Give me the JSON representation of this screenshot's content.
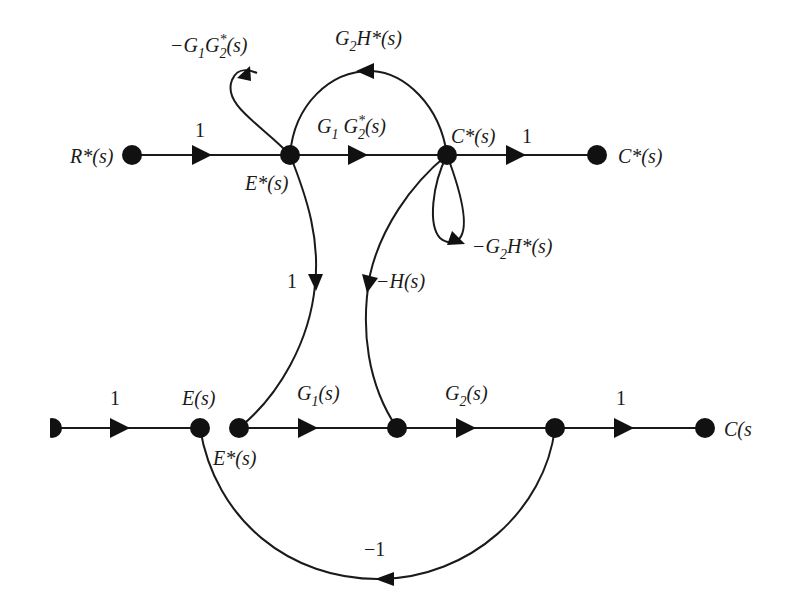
{
  "diagram": {
    "type": "signal-flow-graph",
    "nodes": [
      {
        "id": "R_star",
        "label": "R*(s)",
        "x": 132,
        "y": 155
      },
      {
        "id": "E_star_top",
        "label": "E*(s)",
        "x": 290,
        "y": 155
      },
      {
        "id": "C_star_mid",
        "label": "C*(s)",
        "x": 447,
        "y": 155
      },
      {
        "id": "C_star_out",
        "label": "C*(s)",
        "x": 597,
        "y": 155
      },
      {
        "id": "R_in",
        "label": "",
        "x": 52,
        "y": 428
      },
      {
        "id": "E",
        "label": "E(s)",
        "x": 200,
        "y": 428
      },
      {
        "id": "E_star_bot",
        "label": "E*(s)",
        "x": 239,
        "y": 428
      },
      {
        "id": "N1",
        "label": "",
        "x": 397,
        "y": 428
      },
      {
        "id": "N2",
        "label": "",
        "x": 555,
        "y": 428
      },
      {
        "id": "C",
        "label": "C(s",
        "x": 705,
        "y": 428
      }
    ],
    "edges": [
      {
        "from": "R_star",
        "to": "E_star_top",
        "gain": "1"
      },
      {
        "from": "E_star_top",
        "to": "C_star_mid",
        "gain": "G1 G2*(s)"
      },
      {
        "from": "C_star_mid",
        "to": "C_star_out",
        "gain": "1"
      },
      {
        "from": "E_star_top",
        "to": "E_star_top",
        "gain": "-G1 G2*(s)",
        "kind": "self-loop"
      },
      {
        "from": "C_star_mid",
        "to": "E_star_top",
        "gain": "G2 H*(s)"
      },
      {
        "from": "C_star_mid",
        "to": "C_star_mid",
        "gain": "-G2 H*(s)",
        "kind": "self-loop"
      },
      {
        "from": "E_star_top",
        "to": "E_star_bot",
        "gain": "1"
      },
      {
        "from": "C_star_mid",
        "to": "N1",
        "gain": "-H(s)"
      },
      {
        "from": "R_in",
        "to": "E",
        "gain": "1"
      },
      {
        "from": "E_star_bot",
        "to": "N1",
        "gain": "G1(s)"
      },
      {
        "from": "N1",
        "to": "N2",
        "gain": "G2(s)"
      },
      {
        "from": "N2",
        "to": "C",
        "gain": "1"
      },
      {
        "from": "N2",
        "to": "E",
        "gain": "-1"
      }
    ]
  },
  "labels": {
    "r_star": "R*(s)",
    "e_star_top": "E*(s)",
    "c_star_mid": "C*(s)",
    "c_star_out": "C*(s)",
    "e": "E(s)",
    "e_star_bot": "E*(s)",
    "c_out": "C(s",
    "gain_r_to_e": "1",
    "gain_c_to_out": "1",
    "gain_estar_down": "1",
    "gain_input": "1",
    "gain_n2_to_c": "1",
    "gain_feedback": "−1",
    "gain_neg_h": "−H(s)",
    "g1_bot": {
      "base": "G",
      "sub": "1",
      "rest": "(s)"
    },
    "g2_bot": {
      "base": "G",
      "sub": "2",
      "rest": "(s)"
    }
  }
}
